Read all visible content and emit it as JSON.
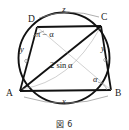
{
  "figure": {
    "caption": "図 6",
    "type": "cyclic-quadrilateral-in-circle",
    "vertices": [
      {
        "id": "A",
        "label": "A",
        "x": 18,
        "y": 92
      },
      {
        "id": "B",
        "label": "B",
        "x": 112,
        "y": 92
      },
      {
        "id": "C",
        "label": "C",
        "x": 102,
        "y": 21
      },
      {
        "id": "D",
        "label": "D",
        "x": 35,
        "y": 23
      }
    ],
    "labels": {
      "side_ad": "y",
      "side_bc": "y",
      "arc_top": "z",
      "arc_bottom": "x",
      "diagonal_ac": "2 sin α",
      "angle_adc": "π − α",
      "angle_b": "α"
    },
    "circle": {
      "cx": 64,
      "cy": 58,
      "r": 47
    }
  }
}
